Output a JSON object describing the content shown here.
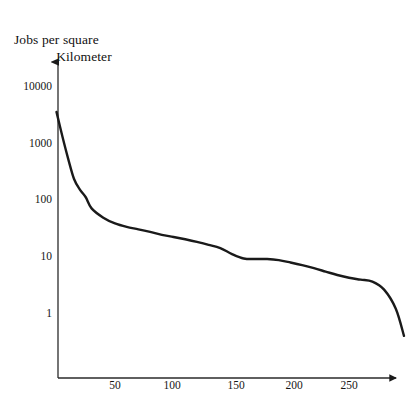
{
  "chart_data": {
    "type": "line",
    "title": "Jobs per square Kilometer",
    "title_line1": "Jobs per square",
    "title_line2": "Kilometer",
    "xlabel": "",
    "ylabel": "Jobs per square Kilometer",
    "yscale": "log",
    "xscale": "linear",
    "grid": false,
    "legend": null,
    "xlim": [
      0,
      300
    ],
    "ylim": [
      0.3,
      20000
    ],
    "ytick_labels": [
      "10000",
      "1000",
      "100",
      "10",
      "1"
    ],
    "ytick_values": [
      10000,
      1000,
      100,
      10,
      1
    ],
    "xtick_labels": [
      "50",
      "100",
      "150",
      "200",
      "250"
    ],
    "xtick_values": [
      50,
      100,
      150,
      200,
      250
    ],
    "series": [
      {
        "name": "Jobs per square kilometer",
        "color": "#1a1a1a",
        "x": [
          0,
          5,
          10,
          15,
          20,
          25,
          30,
          40,
          50,
          60,
          70,
          80,
          90,
          100,
          110,
          120,
          130,
          140,
          150,
          160,
          170,
          180,
          190,
          200,
          210,
          220,
          230,
          240,
          250,
          260,
          270,
          280,
          290,
          297
        ],
        "y": [
          3500,
          1300,
          520,
          230,
          150,
          110,
          70,
          48,
          38,
          33,
          30,
          27,
          24,
          22,
          20,
          18,
          16,
          14,
          11,
          9.2,
          9.0,
          9.0,
          8.6,
          7.8,
          7.0,
          6.2,
          5.4,
          4.7,
          4.2,
          3.9,
          3.6,
          2.6,
          1.2,
          0.4
        ]
      }
    ]
  },
  "axes": {
    "y_arrow": "up-arrow",
    "x_arrow": "right-arrow"
  }
}
